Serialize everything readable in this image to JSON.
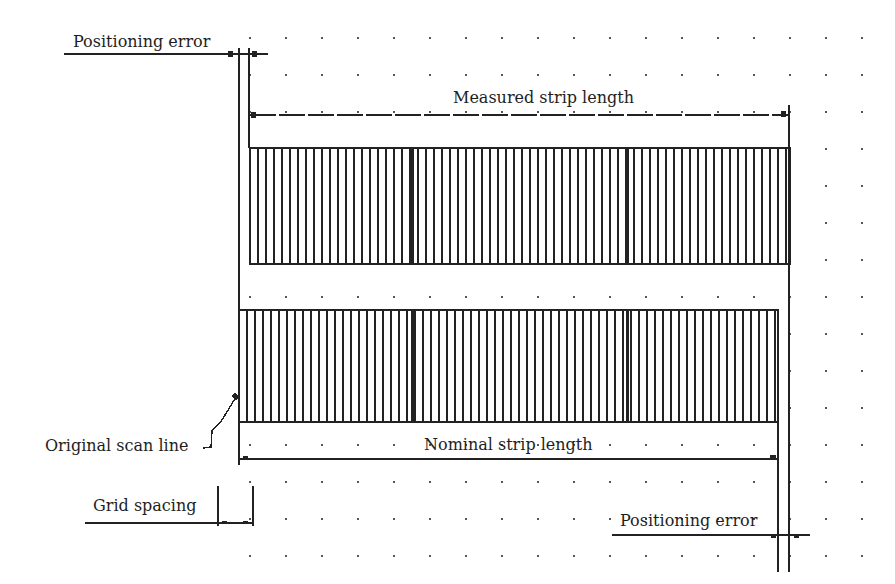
{
  "diagram": {
    "type": "strip-positioning-schematic",
    "labels": {
      "positioning_error_top": "Positioning error",
      "measured_strip_length": "Measured strip length",
      "original_scan_line": "Original scan line",
      "nominal_strip_length": "Nominal strip length",
      "grid_spacing": "Grid spacing",
      "positioning_error_bottom": "Positioning error"
    },
    "colors": {
      "ink": "#222222",
      "dot": "#555555",
      "background": "#ffffff"
    },
    "dot_grid": {
      "x_start": 250,
      "x_step": 36,
      "x_count": 18,
      "y_start": 38,
      "y_step": 37,
      "y_count": 15
    },
    "strips": [
      {
        "name": "measured-strip",
        "x": 250,
        "y": 148,
        "width": 540,
        "height": 116,
        "line_spacing": 8,
        "bold_lines_at": [
          412,
          627
        ]
      },
      {
        "name": "nominal-strip",
        "x": 239,
        "y": 310,
        "width": 539,
        "height": 112,
        "line_spacing": 8,
        "bold_lines_at": [
          412,
          627
        ]
      }
    ]
  }
}
